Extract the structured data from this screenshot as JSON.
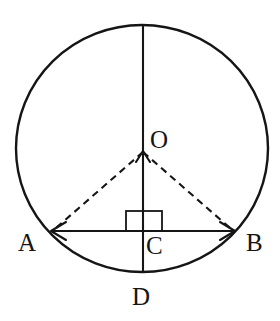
{
  "figure": {
    "type": "geometry-diagram",
    "background_color": "#ffffff",
    "stroke_color": "#151515"
  },
  "circle": {
    "center_x": 142,
    "center_y": 148.5,
    "radius": 123.5,
    "label": "circle"
  },
  "points": [
    {
      "id": "O",
      "label": "O",
      "x": 143,
      "y": 152,
      "label_x": 150,
      "label_y": 147,
      "description": "center of circle"
    },
    {
      "id": "A",
      "label": "A",
      "x": 52,
      "y": 231,
      "label_x": 19,
      "label_y": 250,
      "description": "left endpoint of chord"
    },
    {
      "id": "B",
      "label": "B",
      "x": 234,
      "y": 231,
      "label_x": 247,
      "label_y": 250,
      "description": "right endpoint of chord"
    },
    {
      "id": "C",
      "label": "C",
      "x": 143,
      "y": 231,
      "label_x": 147,
      "label_y": 253,
      "description": "foot of perpendicular on chord AB"
    },
    {
      "id": "D",
      "label": "D",
      "x": 143,
      "y": 272,
      "label_x": 133,
      "label_y": 305,
      "description": "bottom point of circle on vertical line"
    }
  ],
  "segments": [
    {
      "id": "vertical-diameter",
      "style": "solid",
      "from": "top-of-circle",
      "to": "D",
      "x1": 143,
      "y1": 25,
      "x2": 143,
      "y2": 272
    },
    {
      "id": "chord-AB",
      "style": "solid",
      "from": "A",
      "to": "B",
      "x1": 52,
      "y1": 231,
      "x2": 234,
      "y2": 231,
      "arrows": "both"
    },
    {
      "id": "radius-OA",
      "style": "dashed",
      "from": "O",
      "to": "A",
      "x1": 143,
      "y1": 152,
      "x2": 54,
      "y2": 229
    },
    {
      "id": "radius-OB",
      "style": "dashed",
      "from": "O",
      "to": "B",
      "x1": 143,
      "y1": 152,
      "x2": 232,
      "y2": 229
    }
  ],
  "right_angle_marker": {
    "id": "right-angle-at-C",
    "x": 126,
    "y": 211,
    "width": 36,
    "height": 20,
    "description": "square marking perpendicular between OD and AB at C"
  },
  "arrow_marks": [
    {
      "id": "arrow-at-A",
      "direction": "left",
      "x": 52,
      "y": 231
    },
    {
      "id": "arrow-at-B",
      "direction": "right",
      "x": 234,
      "y": 231
    },
    {
      "id": "arrow-at-O",
      "direction": "up",
      "x": 143,
      "y": 152
    }
  ],
  "labels": {
    "O": "O",
    "A": "A",
    "B": "B",
    "C": "C",
    "D": "D"
  }
}
